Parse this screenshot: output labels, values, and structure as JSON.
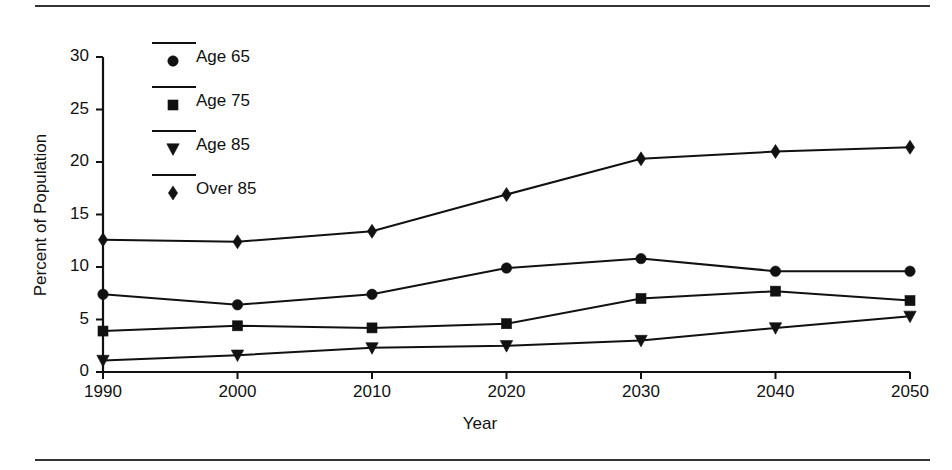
{
  "chart_data": {
    "type": "line",
    "title": "",
    "xlabel": "Year",
    "ylabel": "Percent of Population",
    "categories": [
      1990,
      2000,
      2010,
      2020,
      2030,
      2040,
      2050
    ],
    "xtick_labels": [
      "1990",
      "2000",
      "2010",
      "2020",
      "2030",
      "2040",
      "2050"
    ],
    "ytick_labels": [
      "0",
      "5",
      "10",
      "15",
      "20",
      "25",
      "30"
    ],
    "yticks": [
      0,
      5,
      10,
      15,
      20,
      25,
      30
    ],
    "xlim": [
      1990,
      2050
    ],
    "ylim": [
      0,
      30
    ],
    "grid": false,
    "legend_position": "upper-left-inside",
    "series": [
      {
        "name": "Age 65",
        "marker": "circle",
        "color": "#111111",
        "values": [
          7.4,
          6.4,
          7.4,
          9.9,
          10.8,
          9.6,
          9.6
        ]
      },
      {
        "name": "Age 75",
        "marker": "square",
        "color": "#111111",
        "values": [
          3.9,
          4.4,
          4.2,
          4.6,
          7.0,
          7.7,
          6.8
        ]
      },
      {
        "name": "Age 85",
        "marker": "triangle-down",
        "color": "#111111",
        "values": [
          1.1,
          1.6,
          2.3,
          2.5,
          3.0,
          4.2,
          5.3
        ]
      },
      {
        "name": "Over 85",
        "marker": "diamond",
        "color": "#111111",
        "values": [
          12.6,
          12.4,
          13.4,
          16.9,
          20.3,
          21.0,
          21.4
        ]
      }
    ]
  },
  "legend": {
    "items": [
      {
        "label": "Age 65",
        "marker": "circle"
      },
      {
        "label": "Age 75",
        "marker": "square"
      },
      {
        "label": "Age 85",
        "marker": "triangle-down"
      },
      {
        "label": "Over 85",
        "marker": "diamond"
      }
    ]
  },
  "rules": {
    "top": "horizontal-rule",
    "bottom": "horizontal-rule"
  }
}
